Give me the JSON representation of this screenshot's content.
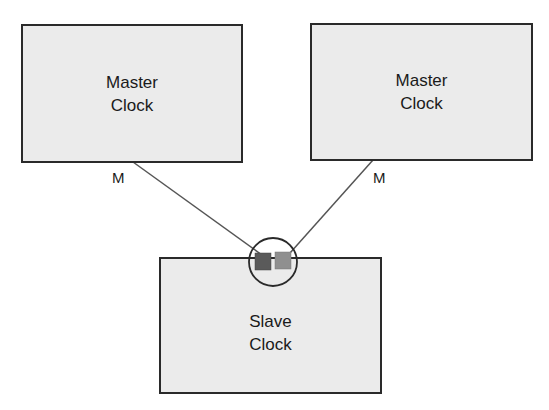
{
  "diagram": {
    "nodes": [
      {
        "id": "master-left",
        "line1": "Master",
        "line2": "Clock"
      },
      {
        "id": "master-right",
        "line1": "Master",
        "line2": "Clock"
      },
      {
        "id": "slave",
        "line1": "Slave",
        "line2": "Clock"
      }
    ],
    "edges": [
      {
        "from": "master-left",
        "to": "slave",
        "label": "M"
      },
      {
        "from": "master-right",
        "to": "slave",
        "label": "M"
      }
    ],
    "colors": {
      "box_fill": "#ebebeb",
      "border": "#2a2a2a",
      "line": "#555555",
      "port_dark": "#5a5a5a",
      "port_light": "#8f8f8f"
    }
  }
}
